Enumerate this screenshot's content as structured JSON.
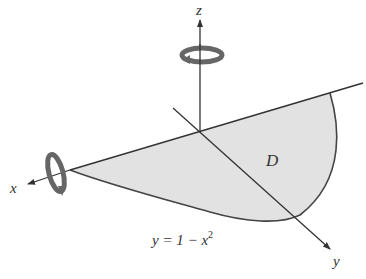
{
  "diagram": {
    "axes": {
      "x_label": "x",
      "y_label": "y",
      "z_label": "z"
    },
    "region": {
      "label": "D",
      "fill": "#e2e2e2",
      "boundary_equation_lhs": "y = 1 − x",
      "boundary_equation_exp": "2"
    },
    "rotation_indicators": [
      {
        "axis": "z",
        "direction": "counterclockwise"
      },
      {
        "axis": "x",
        "direction": "rotation"
      }
    ],
    "colors": {
      "line": "#333333",
      "arrow_band": "#666666",
      "region_fill": "#e2e2e2"
    }
  }
}
